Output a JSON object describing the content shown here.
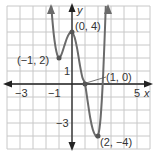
{
  "chart_data": {
    "type": "line",
    "title": "",
    "xlabel": "x",
    "ylabel": "y",
    "xlim": [
      -5,
      6
    ],
    "ylim": [
      -5,
      6
    ],
    "grid": true,
    "x_tick_labels": [
      "-3",
      "-1",
      "5"
    ],
    "y_tick_labels": [
      "1",
      "-3"
    ],
    "labeled_points": [
      {
        "x": -1,
        "y": 2,
        "label": "(−1, 2)"
      },
      {
        "x": 0,
        "y": 4,
        "label": "(0, 4)"
      },
      {
        "x": 1,
        "y": 0,
        "label": "(1, 0)"
      },
      {
        "x": 2,
        "y": -4,
        "label": "(2, −4)"
      }
    ],
    "series": [
      {
        "name": "f(x)",
        "x": [
          -1.6,
          -1.4,
          -1.2,
          -1,
          -0.8,
          -0.6,
          -0.4,
          -0.2,
          0,
          0.2,
          0.4,
          0.6,
          0.8,
          1,
          1.2,
          1.4,
          1.6,
          1.8,
          2,
          2.2,
          2.4,
          2.6
        ],
        "y": [
          6,
          3.8,
          2.5,
          2,
          2.3,
          2.9,
          3.5,
          3.9,
          4,
          3.6,
          2.7,
          1.5,
          0.5,
          0,
          -1.3,
          -2.6,
          -3.5,
          -3.95,
          -4,
          -2.6,
          0.8,
          6
        ]
      }
    ]
  },
  "labels": {
    "x_axis": "x",
    "y_axis": "y",
    "tick_neg3": "−3",
    "tick_neg1": "−1",
    "tick_5": "5",
    "tick_y1": "1",
    "tick_yneg3": "−3",
    "pt_a": "(−1, 2)",
    "pt_b": "(0, 4)",
    "pt_c": "(1, 0)",
    "pt_d": "(2, −4)"
  },
  "colors": {
    "grid": "#c8c8c8",
    "axis": "#222222",
    "curve": "#6b6b6b"
  }
}
